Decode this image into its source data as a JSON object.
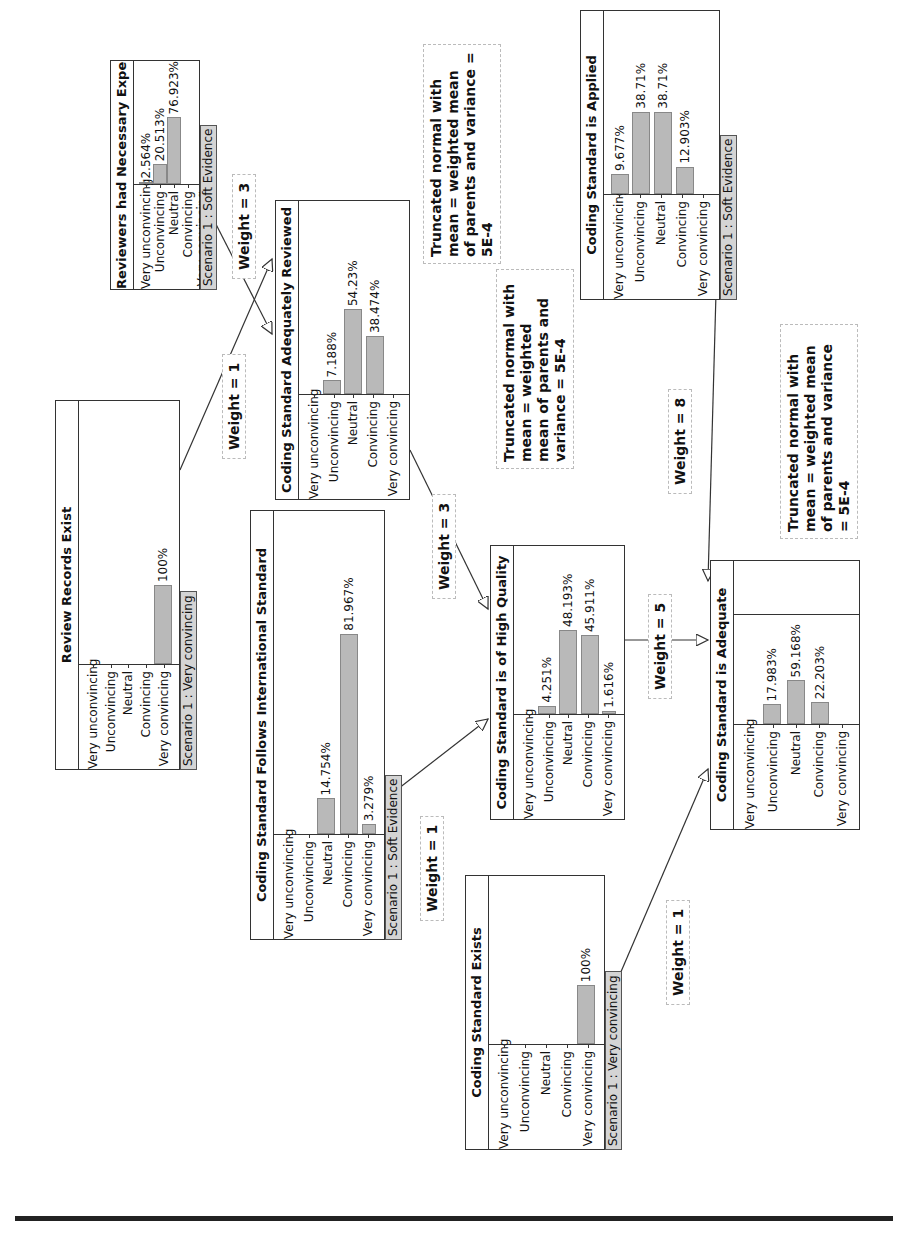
{
  "diagram": {
    "states": [
      "Very unconvincing",
      "Unconvincing",
      "Neutral",
      "Convincing",
      "Very convincing"
    ],
    "nodes": [
      {
        "id": "reviewers_experience",
        "title": "Reviewers had Necessary Experience",
        "values": [
          "2.564%",
          "20.513%",
          "76.923%",
          "",
          ""
        ],
        "probs": [
          2.564,
          20.513,
          76.923,
          0,
          0
        ],
        "evidence": "Scenario 1 : Soft Evidence"
      },
      {
        "id": "review_records_exist",
        "title": "Review Records Exist",
        "values": [
          "",
          "",
          "",
          "",
          "100%"
        ],
        "probs": [
          0,
          0,
          0,
          0,
          100
        ],
        "evidence": "Scenario 1 : Very convincing"
      },
      {
        "id": "adequately_reviewed",
        "title": "Coding Standard Adequately Reviewed",
        "values": [
          "",
          "7.188%",
          "54.23%",
          "38.474%",
          ""
        ],
        "probs": [
          0,
          7.188,
          54.23,
          38.474,
          0
        ],
        "evidence": ""
      },
      {
        "id": "follows_international",
        "title": "Coding Standard Follows International Standard",
        "values": [
          "",
          "",
          "14.754%",
          "81.967%",
          "3.279%"
        ],
        "probs": [
          0,
          0,
          14.754,
          81.967,
          3.279
        ],
        "evidence": "Scenario 1 : Soft Evidence"
      },
      {
        "id": "high_quality",
        "title": "Coding Standard is of High Quality",
        "values": [
          "",
          "4.251%",
          "48.193%",
          "45.911%",
          "1.616%"
        ],
        "probs": [
          0,
          4.251,
          48.193,
          45.911,
          1.616
        ],
        "evidence": ""
      },
      {
        "id": "standard_exists",
        "title": "Coding Standard Exists",
        "values": [
          "",
          "",
          "",
          "",
          "100%"
        ],
        "probs": [
          0,
          0,
          0,
          0,
          100
        ],
        "evidence": "Scenario 1 : Very convincing"
      },
      {
        "id": "is_applied",
        "title": "Coding Standard is Applied",
        "values": [
          "9.677%",
          "38.71%",
          "38.71%",
          "12.903%",
          ""
        ],
        "probs": [
          9.677,
          38.71,
          38.71,
          12.903,
          0
        ],
        "evidence": "Scenario 1 : Soft Evidence"
      },
      {
        "id": "is_adequate",
        "title": "Coding Standard is Adequate",
        "values": [
          "",
          "17.983%",
          "59.168%",
          "22.203%",
          ""
        ],
        "probs": [
          0,
          17.983,
          59.168,
          22.203,
          0
        ],
        "evidence": ""
      }
    ],
    "weights": [
      {
        "id": "w_experience",
        "label": "Weight = 3"
      },
      {
        "id": "w_records",
        "label": "Weight = 1"
      },
      {
        "id": "w_reviewed",
        "label": "Weight = 3"
      },
      {
        "id": "w_international",
        "label": "Weight = 1"
      },
      {
        "id": "w_quality",
        "label": "Weight = 5"
      },
      {
        "id": "w_exists",
        "label": "Weight = 1"
      },
      {
        "id": "w_applied",
        "label": "Weight = 8"
      }
    ],
    "notes": [
      {
        "id": "note_reviewed",
        "text": "Truncated normal with mean = weighted mean of parents and variance = 5E-4"
      },
      {
        "id": "note_quality",
        "text": "Truncated normal with mean = weighted mean of parents and variance = 5E-4"
      },
      {
        "id": "note_adequate",
        "text": "Truncated normal with mean = weighted mean of parents and variance = 5E-4"
      }
    ],
    "colors": {
      "bar": "#b9b9b9",
      "evidence_bg": "#d4d4d4",
      "border": "#333333"
    }
  }
}
